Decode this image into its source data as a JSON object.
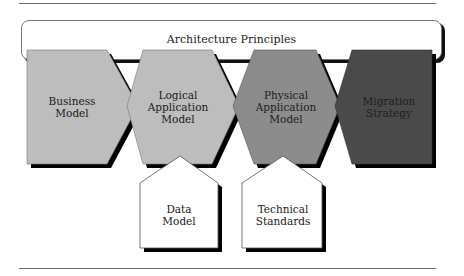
{
  "diagram": {
    "top_banner": {
      "label": "Architecture Principles"
    },
    "process_stages": [
      {
        "label_line1": "Business",
        "label_line2": "Model",
        "fill": "#bdbdbd"
      },
      {
        "label_line1": "Logical",
        "label_line2": "Application",
        "label_line3": "Model",
        "fill": "#bdbdbd"
      },
      {
        "label_line1": "Physical",
        "label_line2": "Application",
        "label_line3": "Model",
        "fill": "#8c8c8c"
      },
      {
        "label_line1": "Migration",
        "label_line2": "Strategy",
        "fill": "#4a4a4a"
      }
    ],
    "inputs": [
      {
        "label_line1": "Data",
        "label_line2": "Model",
        "feeds": "Logical Application Model"
      },
      {
        "label_line1": "Technical",
        "label_line2": "Standards",
        "feeds": "Physical Application Model"
      }
    ],
    "colors": {
      "shadow": "#000000",
      "outline": "#6a6a6a",
      "input_fill": "#ffffff"
    }
  }
}
